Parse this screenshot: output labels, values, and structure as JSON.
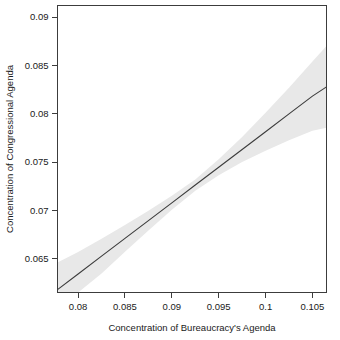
{
  "chart_data": {
    "type": "line",
    "title": "",
    "xlabel": "Concentration of Bureaucracy's Agenda",
    "ylabel": "Concentration of Congressional Agenda",
    "xlim": [
      0.0778,
      0.1065
    ],
    "ylim": [
      0.0615,
      0.0912
    ],
    "xticks": [
      0.08,
      0.085,
      0.09,
      0.095,
      0.1,
      0.105
    ],
    "xticklabels": [
      "0.08",
      "0.085",
      "0.09",
      "0.095",
      "0.1",
      "0.105"
    ],
    "yticks": [
      0.065,
      0.07,
      0.075,
      0.08,
      0.085,
      0.09
    ],
    "yticklabels": [
      "0.065",
      "0.07",
      "0.075",
      "0.08",
      "0.085",
      "0.09"
    ],
    "grid": false,
    "legend": null,
    "series": [
      {
        "name": "fitted regression line",
        "x": [
          0.0778,
          0.08,
          0.0825,
          0.085,
          0.0875,
          0.09,
          0.0925,
          0.095,
          0.0975,
          0.1,
          0.1025,
          0.105,
          0.1065
        ],
        "values": [
          0.0618,
          0.06342,
          0.06526,
          0.0671,
          0.06894,
          0.07078,
          0.07262,
          0.07446,
          0.0763,
          0.07814,
          0.07998,
          0.08182,
          0.08278
        ]
      },
      {
        "name": "confidence band upper",
        "x": [
          0.0778,
          0.08,
          0.0825,
          0.085,
          0.0875,
          0.09,
          0.0925,
          0.095,
          0.0975,
          0.1,
          0.1025,
          0.105,
          0.1065
        ],
        "values": [
          0.0646,
          0.0657,
          0.06706,
          0.06848,
          0.06996,
          0.0715,
          0.0732,
          0.07528,
          0.0776,
          0.0801,
          0.0827,
          0.0854,
          0.087
        ]
      },
      {
        "name": "confidence band lower",
        "x": [
          0.0778,
          0.08,
          0.0825,
          0.085,
          0.0875,
          0.09,
          0.0925,
          0.095,
          0.0975,
          0.1,
          0.1025,
          0.105,
          0.1065
        ],
        "values": [
          0.059,
          0.06114,
          0.06346,
          0.06572,
          0.06792,
          0.07006,
          0.07204,
          0.07364,
          0.075,
          0.07618,
          0.07726,
          0.07824,
          0.07856
        ]
      }
    ],
    "colors": {
      "line": "#3c3c3c",
      "band": "#e8e8e8",
      "axis": "#3c3c3c",
      "text": "#1a1a1a",
      "background": "#ffffff"
    }
  }
}
